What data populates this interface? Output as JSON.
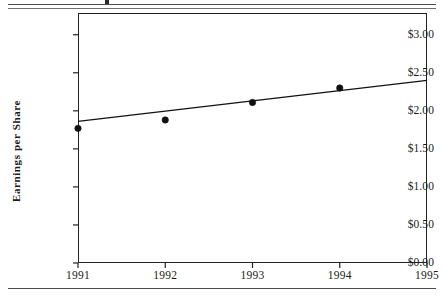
{
  "figure": {
    "name": "earnings-per-share-scatter-with-trendline",
    "y_axis_title": "Earnings  per  Share",
    "has_top_rule": true,
    "has_bottom_rule": true
  },
  "chart_data": {
    "type": "scatter",
    "title": "",
    "subtitle": "",
    "xlabel": "",
    "ylabel": "Earnings  per  Share",
    "x": [
      1991,
      1992,
      1993,
      1994
    ],
    "values": [
      1.77,
      1.88,
      2.11,
      2.3
    ],
    "series": [
      {
        "name": "Earnings per Share",
        "marker": "filled-circle",
        "color": "#111111",
        "points": [
          {
            "x": 1991,
            "y": 1.77
          },
          {
            "x": 1992,
            "y": 1.88
          },
          {
            "x": 1993,
            "y": 2.11
          },
          {
            "x": 1994,
            "y": 2.3
          }
        ]
      },
      {
        "name": "Trend line",
        "type": "line",
        "color": "#111111",
        "points": [
          {
            "x": 1991,
            "y": 1.86
          },
          {
            "x": 1995,
            "y": 2.4
          }
        ]
      }
    ],
    "xlim": [
      1991,
      1995
    ],
    "ylim": [
      0.0,
      3.2857
    ],
    "xticks": [
      1991,
      1992,
      1993,
      1994,
      1995
    ],
    "xtick_labels": [
      "1991",
      "1992",
      "1993",
      "1994",
      "1995"
    ],
    "yticks": [
      0.0,
      0.5,
      1.0,
      1.5,
      2.0,
      2.5,
      3.0
    ],
    "ytick_labels": [
      "$0.00",
      "$0.50",
      "$1.00",
      "$1.50",
      "$2.00",
      "$2.50",
      "$3.00"
    ],
    "grid": false,
    "legend": null,
    "legend_position": "none",
    "annotations": [],
    "frame": "box"
  }
}
